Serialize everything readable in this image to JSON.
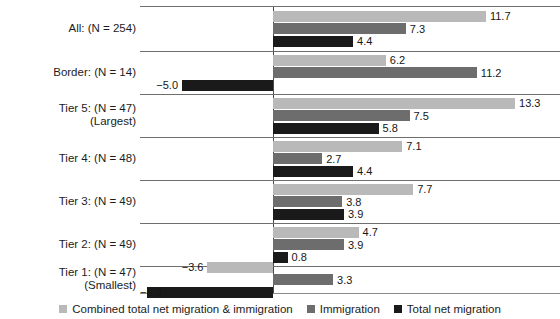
{
  "chart_data": {
    "type": "bar",
    "orientation": "horizontal",
    "title": "",
    "xlabel": "",
    "ylabel": "",
    "grid": false,
    "legend_position": "bottom",
    "xlim": [
      -8.0,
      14.5
    ],
    "zero_line": true,
    "categories": [
      {
        "line1": "All: (N = 254)",
        "line2": ""
      },
      {
        "line1": "Border: (N = 14)",
        "line2": ""
      },
      {
        "line1": "Tier 5: (N = 47)",
        "line2": "(Largest)"
      },
      {
        "line1": "Tier 4: (N = 48)",
        "line2": ""
      },
      {
        "line1": "Tier 3: (N = 49)",
        "line2": ""
      },
      {
        "line1": "Tier 2: (N = 49)",
        "line2": ""
      },
      {
        "line1": "Tier 1: (N = 47)",
        "line2": "(Smallest)"
      }
    ],
    "series": [
      {
        "name": "Combined total net migration & immigration",
        "color": "#b9b9b9",
        "values": [
          11.7,
          6.2,
          13.3,
          7.1,
          7.7,
          4.7,
          -3.6
        ],
        "labels": [
          "11.7",
          "6.2",
          "13.3",
          "7.1",
          "7.7",
          "4.7",
          "−3.6"
        ]
      },
      {
        "name": "Immigration",
        "color": "#6d6d6d",
        "values": [
          7.3,
          11.2,
          7.5,
          2.7,
          3.8,
          3.9,
          3.3
        ],
        "labels": [
          "7.3",
          "11.2",
          "7.5",
          "2.7",
          "3.8",
          "3.9",
          "3.3"
        ]
      },
      {
        "name": "Total net migration",
        "color": "#1a1a1a",
        "values": [
          4.4,
          -5.0,
          5.8,
          4.4,
          3.9,
          0.8,
          -6.9
        ],
        "labels": [
          "4.4",
          "−5.0",
          "5.8",
          "4.4",
          "3.9",
          "0.8",
          "−6.9"
        ]
      }
    ]
  },
  "legend": {
    "items": [
      {
        "label": "Combined total net migration & immigration",
        "swatch": "s0"
      },
      {
        "label": "Immigration",
        "swatch": "s1"
      },
      {
        "label": "Total net migration",
        "swatch": "s2"
      }
    ]
  }
}
